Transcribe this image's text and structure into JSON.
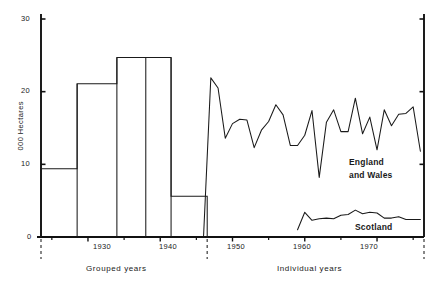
{
  "chart_data": {
    "type": "line",
    "title": "",
    "xlabel": "",
    "ylabel": "000 Hectares",
    "ylim": [
      0,
      30
    ],
    "xlim": [
      1923.5,
      1976.5
    ],
    "grid": false,
    "legend_position": "inline-annotation",
    "y_ticks": [
      0,
      10,
      20,
      30
    ],
    "y_tick_labels": [
      "0",
      "10",
      "20",
      "30"
    ],
    "x_ticks": [
      1930,
      1940,
      1950,
      1960,
      1970
    ],
    "x_tick_labels": [
      "1930",
      "1940",
      "1950",
      "1960",
      "1970"
    ],
    "x_minor_ticks": [
      1925,
      1935,
      1945,
      1955,
      1965,
      1975
    ],
    "sections": [
      {
        "name": "Grouped years",
        "label": "Grouped years",
        "x_start": 1923.5,
        "x_end": 1946.5
      },
      {
        "name": "Individual years",
        "label": "Individual years",
        "x_start": 1946.5,
        "x_end": 1976.5
      }
    ],
    "dividers": [
      1923.5,
      1946.5,
      1976.5
    ],
    "series": [
      {
        "name": "Grouped years bars",
        "type": "step",
        "values": [
          {
            "x_start": 1923.5,
            "x_end": 1928.5,
            "value": 9.4
          },
          {
            "x_start": 1928.5,
            "x_end": 1934.0,
            "value": 21.1
          },
          {
            "x_start": 1934.0,
            "x_end": 1938.0,
            "value": 24.7
          },
          {
            "x_start": 1938.0,
            "x_end": 1941.5,
            "value": 24.7
          },
          {
            "x_start": 1941.5,
            "x_end": 1946.5,
            "value": 5.6
          }
        ]
      },
      {
        "name": "England and Wales",
        "label_line1": "England",
        "label_line2": "and Wales",
        "type": "line",
        "x": [
          1946,
          1947,
          1948,
          1949,
          1950,
          1951,
          1952,
          1953,
          1954,
          1955,
          1956,
          1957,
          1958,
          1959,
          1960,
          1961,
          1962,
          1963,
          1964,
          1965,
          1966,
          1967,
          1968,
          1969,
          1970,
          1971,
          1972,
          1973,
          1974,
          1975,
          1976
        ],
        "values": [
          0.2,
          21.9,
          20.5,
          13.6,
          15.6,
          16.2,
          16.1,
          12.3,
          14.7,
          15.9,
          18.2,
          16.8,
          12.6,
          12.6,
          14.0,
          17.4,
          8.2,
          15.8,
          17.5,
          14.5,
          14.5,
          19.1,
          14.2,
          16.5,
          12.0,
          17.5,
          15.3,
          16.9,
          17.0,
          17.9,
          11.8
        ]
      },
      {
        "name": "Scotland",
        "label": "Scotland",
        "type": "line",
        "x": [
          1959,
          1960,
          1961,
          1962,
          1963,
          1964,
          1965,
          1966,
          1967,
          1968,
          1969,
          1970,
          1971,
          1972,
          1973,
          1974,
          1975,
          1976
        ],
        "values": [
          1.0,
          3.4,
          2.3,
          2.5,
          2.6,
          2.5,
          3.0,
          3.1,
          3.7,
          3.2,
          3.4,
          3.3,
          2.6,
          2.6,
          2.8,
          2.4,
          2.4,
          2.4
        ]
      }
    ]
  },
  "axis": {
    "y_title": "000 Hectares",
    "y_labels": [
      "30",
      "20",
      "10",
      "0"
    ],
    "x_labels": [
      "1930",
      "1940",
      "1950",
      "1960",
      "1970"
    ]
  },
  "annotations": {
    "england_wales_line1": "England",
    "england_wales_line2": "and Wales",
    "scotland": "Scotland",
    "grouped_years": "Grouped  years",
    "individual_years": "Individual  years"
  },
  "colors": {
    "line": "#1a1a1a",
    "axis": "#111111",
    "background": "#ffffff",
    "divider": "#555555"
  }
}
